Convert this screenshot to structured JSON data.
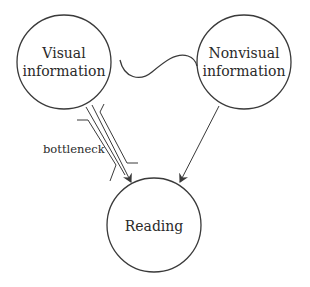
{
  "diagram": {
    "nodes": [
      {
        "id": "visual",
        "line1": "Visual",
        "line2": "information"
      },
      {
        "id": "nonvisual",
        "line1": "Nonvisual",
        "line2": "information"
      },
      {
        "id": "reading",
        "line1": "Reading"
      }
    ],
    "edges": [
      {
        "from": "visual",
        "to": "reading",
        "label": "bottleneck"
      },
      {
        "from": "nonvisual",
        "to": "reading",
        "label": ""
      }
    ],
    "connector": {
      "between": [
        "visual",
        "nonvisual"
      ],
      "shape": "wave-icon"
    },
    "colors": {
      "stroke": "#3a3a3a",
      "text": "#2a2a2a",
      "background": "#ffffff"
    }
  }
}
